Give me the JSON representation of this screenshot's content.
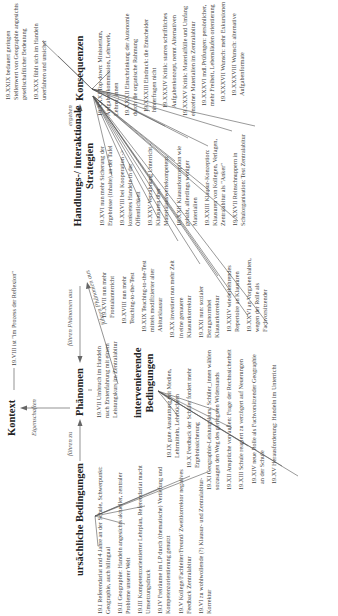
{
  "diagram": {
    "type": "paradigm-model",
    "nodes": {
      "kontext": {
        "label": "Kontext",
        "note": "19.VIII ist \"im Prozess der Reflexion\""
      },
      "phaenomen": {
        "label": "Phänomen",
        "items": [
          "19.VII Umbruch im Handeln nach Erstenfahrung mit einem Leistungskurs im Zentralabitur"
        ]
      },
      "ursaechliche": {
        "label": "ursächliche Bedingungen"
      },
      "intervenierende": {
        "label_line1": "intervenierende",
        "label_line2": "Bedingungen"
      },
      "strategien": {
        "label_line1": "Handlungs-/ interaktionale",
        "label_line2": "Strategien"
      },
      "konsequenzen": {
        "label": "Konsequenzen"
      }
    },
    "edges": {
      "eigenschaften": "Eigenschaften",
      "fuehren_zu": "führen zu",
      "fuehren_phaenomen_aus_1": "führen Phänomen aus",
      "fuehren_phaenomen_aus_2": "führen Phänomen aus",
      "ergeben": "ergeben"
    },
    "ursaechliche_items": [
      "19.I Referendariat und 4 Jahre an der Schule, Schwerpunkt: Geographie, auch bilingual",
      "19.II Geographie: Handeln angesichts aktueller, zentraler Probleme unserer Welt",
      "19.III Kompetenzorientierter Lehrplan, Referendariat macht Umsetzungsdruck",
      "19.IV Freiräume im LP durch (thematische) Vertiefung und Kompetenzorientierung genutzt",
      "19.V Kollege/Fachleiter/Freund/ Zweitkorrektor negatives Feedback Zentralabitur",
      "19.VI zu wohlwollende (?) Klausur- und Zentralabitur-Korrektur"
    ],
    "intervenierende_items": [
      "19.IX gute Ausstattung mit Medien, Lehrmitteln, Lehrbüchern",
      "19.X Feedback der Schüler fordert mehr Ergebnissicherung",
      "19.XI Geographie-Leistungskurs: Schüler_innen wählen sozusagen den Weg des geringsten Widerstands",
      "19.XII Ansprüche von außen: Frage der Rechtssicherheit",
      "19.XIII Schule reagiert zu verzögert auf Neuerungen",
      "19.XIV neue Rolle als Fachvorsitzender Geographie an der Schule",
      "19.XV Herausforderung: Handeln im Unterricht"
    ],
    "strategien_items": [
      "19.XVI nun mehr Sicherung der Ergebnisse (Inhalte) an der Tafel",
      "19.XVII nun mehr Frontalunterricht",
      "19.XVIII nun mehr Teaching-to-the-Test",
      "19.XIX Teaching-to-the-Test mittels modifizierter alter Abiturklausur",
      "19.XX investiert nun mehr Zeit in eine genauere Klausurkorrektur",
      "19.XXI nun: sozialer Bezugsnormbei Klausurkorrektur",
      "19.XXII Klausurkonzeption wie gehabt, allerdings weniger Materialien",
      "19.XXIII Klausur-Konzeption: Klausuren von Kollegen, Verlagen, Zentralabitur als \"Anker\"",
      "19.XXIV wiederkehrendes Repertoire an Klausuren",
      "19.XXV Verzahnung Unterricht - Klausuren über Materialauswertekompetenz",
      "19.XXVI an Vorgaben halten, wegen der Rolle als Fachvorsitzender",
      "19.XXVII Reinschnuppern in Schulorganisation: Test Zentralabitur",
      "19.XXVIII bei Kooperation -> konkretes Handeln in der Öffentlichkeit"
    ],
    "konsequenzen_items": [
      "19.XXIX bedauert geringen Stellenwert von Geographie angesichts gesellschaftlicher Bedeutung",
      "19.XXX fühlt sich im Handeln unerfahren und unsicher",
      "19.XXXI Top-down: Ministerium, Aufgabenkommission, Lehrwerk, Lehrer_innen",
      "19.XXXII Einschränkung der Autonomie durch die organische Rahmung",
      "19.XXXIII Eindruck: die Entscheider hinterfragen nicht",
      "19.XXXIV Kritik: starres schriftliches Aufgabenkonzept, nennt Alternativen",
      "19.XXXV Kritik: Materialfülle und Umfang einzelner Materialien im Zentralabitur",
      "19.XXXVI mdl.Prüfungen: persönlicher, mehr Freiheit, Lebensläufen orientierung",
      "19.XXXVII Wunsch: mehr Exkursionen",
      "19.XXXVIII Wunsch: alternative Aufgabenformate"
    ]
  }
}
